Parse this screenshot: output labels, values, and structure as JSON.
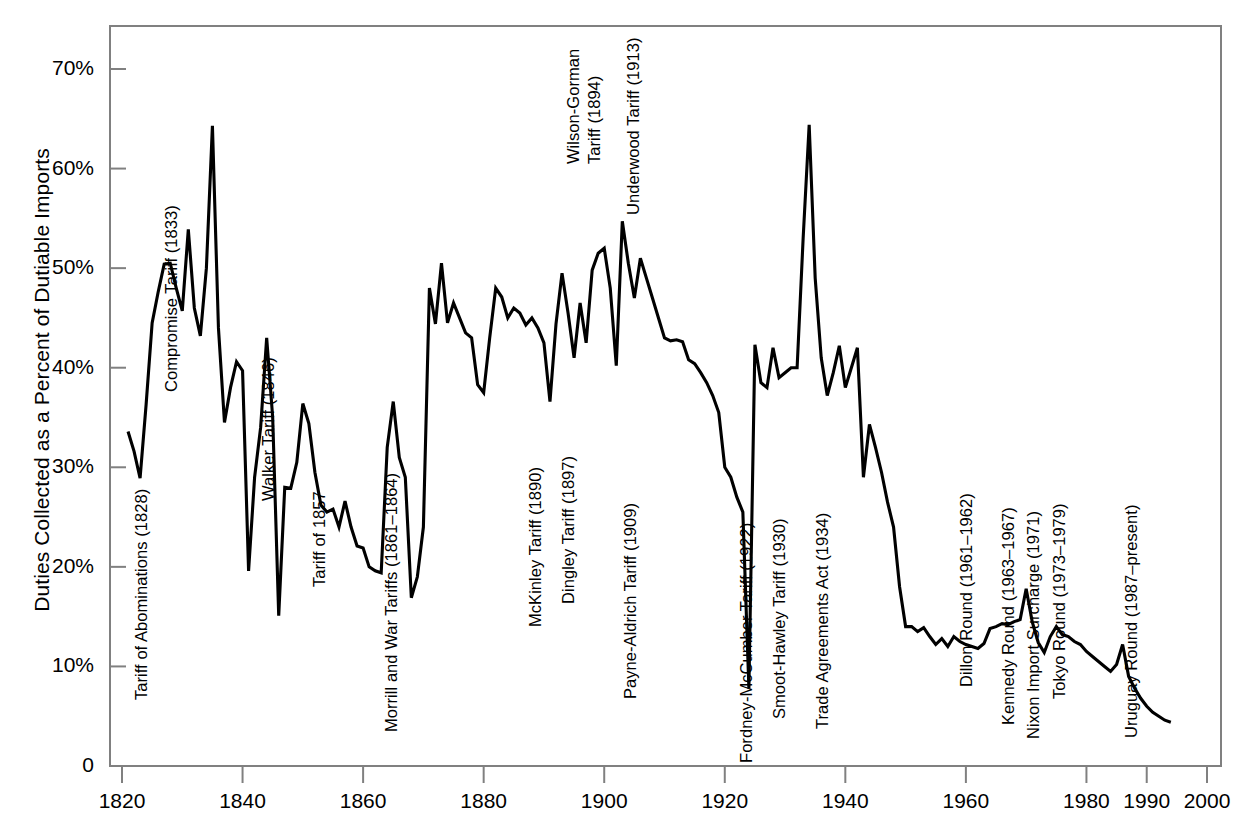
{
  "chart_data": {
    "type": "line",
    "title": "",
    "xlabel": "",
    "ylabel": "Duties Collected as a Percent of Dutiable Imports",
    "xlim": [
      1818,
      2000
    ],
    "ylim": [
      0,
      75
    ],
    "grid": false,
    "legend": null,
    "y_tick_labels": [
      "0",
      "10%",
      "20%",
      "30%",
      "40%",
      "50%",
      "60%",
      "70%"
    ],
    "y_ticks": [
      0,
      10,
      20,
      30,
      40,
      50,
      60,
      70
    ],
    "x_tick_labels": [
      "1820",
      "1840",
      "1860",
      "1880",
      "1900",
      "1920",
      "1940",
      "1960",
      "1980",
      "1990",
      "2000"
    ],
    "x_ticks": [
      1820,
      1840,
      1860,
      1880,
      1900,
      1920,
      1940,
      1960,
      1980,
      1990,
      2000
    ],
    "series_name": "Duties collected as a percent of dutiable imports",
    "x": [
      1821,
      1822,
      1823,
      1824,
      1825,
      1826,
      1827,
      1828,
      1829,
      1830,
      1831,
      1832,
      1833,
      1834,
      1835,
      1836,
      1837,
      1838,
      1839,
      1840,
      1841,
      1842,
      1843,
      1844,
      1845,
      1846,
      1847,
      1848,
      1849,
      1850,
      1851,
      1852,
      1853,
      1854,
      1855,
      1856,
      1857,
      1858,
      1859,
      1860,
      1861,
      1862,
      1863,
      1864,
      1865,
      1866,
      1867,
      1868,
      1869,
      1870,
      1871,
      1872,
      1873,
      1874,
      1875,
      1876,
      1877,
      1878,
      1879,
      1880,
      1881,
      1882,
      1883,
      1884,
      1885,
      1886,
      1887,
      1888,
      1889,
      1890,
      1891,
      1892,
      1893,
      1894,
      1895,
      1896,
      1897,
      1898,
      1899,
      1900,
      1901,
      1902,
      1903,
      1904,
      1905,
      1906,
      1907,
      1908,
      1909,
      1910,
      1911,
      1912,
      1913,
      1914,
      1915,
      1916,
      1917,
      1918,
      1919,
      1920,
      1921,
      1922,
      1923,
      1924,
      1925,
      1926,
      1927,
      1928,
      1929,
      1930,
      1931,
      1932,
      1933,
      1934,
      1935,
      1936,
      1937,
      1938,
      1939,
      1940,
      1941,
      1942,
      1943,
      1944,
      1945,
      1946,
      1947,
      1948,
      1949,
      1950,
      1951,
      1952,
      1953,
      1954,
      1955,
      1956,
      1957,
      1958,
      1959,
      1960,
      1961,
      1962,
      1963,
      1964,
      1965,
      1966,
      1967,
      1968,
      1969,
      1970,
      1971,
      1972,
      1973,
      1974,
      1975,
      1976,
      1977,
      1978,
      1979,
      1980,
      1981,
      1982,
      1983,
      1984,
      1985,
      1986,
      1987,
      1988,
      1989,
      1990,
      1991,
      1992,
      1993,
      1994
    ],
    "y": [
      33.6,
      31.6,
      28.9,
      36.3,
      44.5,
      47.6,
      50.4,
      50.5,
      48.0,
      45.7,
      53.9,
      46.0,
      43.2,
      50.0,
      64.3,
      44.0,
      34.5,
      38.0,
      40.6,
      39.7,
      19.6,
      29.0,
      34.0,
      43.0,
      35.0,
      15.1,
      28.0,
      27.9,
      30.5,
      36.4,
      34.4,
      29.5,
      26.2,
      25.5,
      25.8,
      24.0,
      26.6,
      24.0,
      22.1,
      21.9,
      20.0,
      19.6,
      19.4,
      32.0,
      36.6,
      31.0,
      29.0,
      16.9,
      19.0,
      24.0,
      48.0,
      44.4,
      50.5,
      44.5,
      46.5,
      45.0,
      43.5,
      43.0,
      38.3,
      37.5,
      43.0,
      48.0,
      47.1,
      45.0,
      46.0,
      45.5,
      44.3,
      45.0,
      44.0,
      42.5,
      36.6,
      44.4,
      49.5,
      45.5,
      41.0,
      46.5,
      42.5,
      49.8,
      51.5,
      52.0,
      48.0,
      40.2,
      54.7,
      50.5,
      47.0,
      51.0,
      49.0,
      47.0,
      45.0,
      43.0,
      42.7,
      42.8,
      42.6,
      40.8,
      40.4,
      39.5,
      38.5,
      37.2,
      35.5,
      30.0,
      29.0,
      27.0,
      25.5,
      7.8,
      42.3,
      38.5,
      38.0,
      42.0,
      39.0,
      39.5,
      40.0,
      40.0,
      53.0,
      64.4,
      49.0,
      41.0,
      37.2,
      39.5,
      42.2,
      38.0,
      40.0,
      42.0,
      29.0,
      34.3,
      32.0,
      29.5,
      26.5,
      24.0,
      18.0,
      14.0,
      14.0,
      13.5,
      13.9,
      13.0,
      12.2,
      12.8,
      12.0,
      13.0,
      12.5,
      12.2,
      12.0,
      11.8,
      12.3,
      13.8,
      14.0,
      14.3,
      14.2,
      14.5,
      14.7,
      17.8,
      14.5,
      12.4,
      11.4,
      13.0,
      14.0,
      13.2,
      13.0,
      12.5,
      12.2,
      11.5,
      11.0,
      10.5,
      10.0,
      9.5,
      10.2,
      12.2,
      9.0,
      7.8,
      6.8,
      6.0,
      5.4,
      5.0,
      4.6,
      4.4,
      4.4,
      4.4
    ]
  },
  "annotations": [
    {
      "label": "Tariff of Abominations (1828)",
      "x": 151,
      "y": 681
    },
    {
      "label": "Compromise Tariff (1833)",
      "x": 181,
      "y": 373
    },
    {
      "label": "Walker Tariff (1846)",
      "x": 278,
      "y": 482
    },
    {
      "label": "Tariff of 1857",
      "x": 329,
      "y": 568
    },
    {
      "label": "Morrill and War Tariffs (1861–1864)",
      "x": 401,
      "y": 713
    },
    {
      "label": "McKinley  Tariff (1890)",
      "x": 545,
      "y": 608
    },
    {
      "label": "Dingley Tariff (1897)",
      "x": 578,
      "y": 585
    },
    {
      "label": "Payne-Aldrich Tariff (1909)",
      "x": 640,
      "y": 680
    },
    {
      "label": "Wilson-Gorman",
      "x": 583,
      "y": 145
    },
    {
      "label": "Tariff (1894)",
      "x": 604,
      "y": 145
    },
    {
      "label": "Underwood Tariff (1913)",
      "x": 643,
      "y": 196
    },
    {
      "label": "Fordney-McCumber Tariff (1922)",
      "x": 756,
      "y": 744
    },
    {
      "label": "Smoot-Hawley Tariff (1930)",
      "x": 789,
      "y": 700
    },
    {
      "label": "Trade Agreements Act (1934)",
      "x": 832,
      "y": 710
    },
    {
      "label": "Dillon Round (1961–1962)",
      "x": 976,
      "y": 668
    },
    {
      "label": "Kennedy Round (1963–1967)",
      "x": 1018,
      "y": 706
    },
    {
      "label": "Nixon Import Surcharge (1971)",
      "x": 1043,
      "y": 720
    },
    {
      "label": "Tokyo Round (1973–1979)",
      "x": 1069,
      "y": 680
    },
    {
      "label": "Uruguay Round (1987–present)",
      "x": 1141,
      "y": 719
    }
  ],
  "style": {
    "line_color": "#000000",
    "axis_color": "#808080",
    "background": "#ffffff"
  }
}
